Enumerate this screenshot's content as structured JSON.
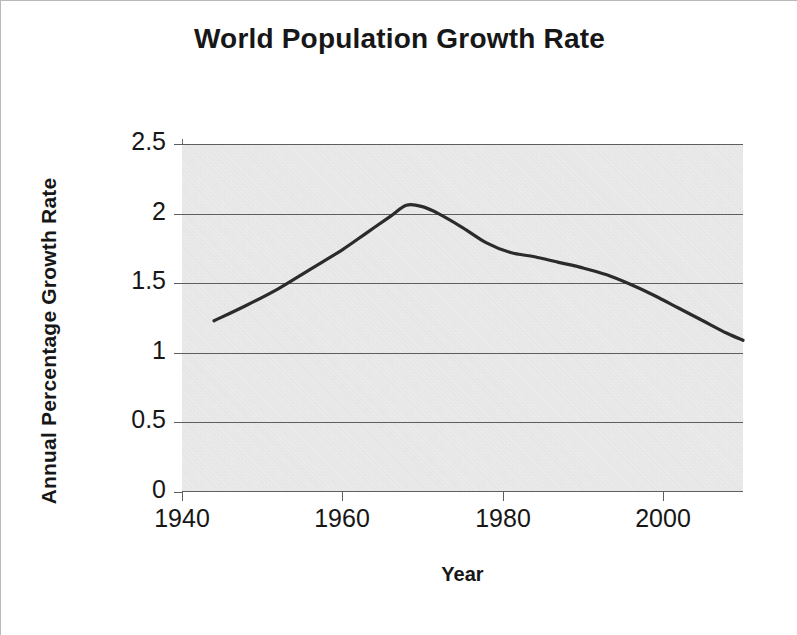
{
  "chart_data": {
    "type": "line",
    "title": "World Population Growth Rate",
    "xlabel": "Year",
    "ylabel": "Annual Percentage Growth Rate",
    "xlim": [
      1940,
      2010
    ],
    "ylim": [
      0,
      2.5
    ],
    "grid": true,
    "legend": "none",
    "plot_background": "#e4e4e4",
    "line_color": "#2b2b2b",
    "x_ticks": [
      1940,
      1960,
      1980,
      2000
    ],
    "x_tick_labels": [
      "1940",
      "1960",
      "1980",
      "2000"
    ],
    "y_ticks": [
      0,
      0.5,
      1,
      1.5,
      2,
      2.5
    ],
    "y_tick_labels": [
      "0",
      "0.5",
      "1",
      "1.5",
      "2",
      "2.5"
    ],
    "x": [
      1944,
      1948,
      1952,
      1956,
      1960,
      1963,
      1966,
      1968,
      1970,
      1972,
      1975,
      1978,
      1981,
      1984,
      1987,
      1990,
      1993,
      1996,
      1999,
      2002,
      2005,
      2008,
      2010
    ],
    "values": [
      1.23,
      1.34,
      1.46,
      1.6,
      1.74,
      1.86,
      1.98,
      2.06,
      2.05,
      2.0,
      1.9,
      1.79,
      1.72,
      1.69,
      1.65,
      1.61,
      1.56,
      1.49,
      1.41,
      1.32,
      1.23,
      1.14,
      1.09
    ],
    "series_name": "Annual Percentage Growth Rate",
    "peak": {
      "year": 1968,
      "value": 2.06
    },
    "start_point": {
      "year": 1944,
      "value": 1.23
    },
    "end_point": {
      "year": 2010,
      "value": 1.09
    }
  }
}
